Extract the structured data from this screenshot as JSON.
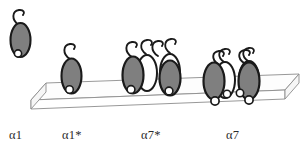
{
  "figure": {
    "type": "schematic-diagram",
    "background_color": "#ffffff",
    "colors": {
      "subunit_fill": "#7f7f7f",
      "subunit_outline": "#1a1a1a",
      "ghost_subunit_fill": "#ffffff",
      "ghost_subunit_outline": "#1a1a1a",
      "pore_circle_fill": "#ffffff",
      "pore_circle_outline": "#1a1a1a",
      "membrane_face": "#fdfdfd",
      "membrane_edge": "#8c8c8c",
      "tail_stroke": "#1a1a1a",
      "label_text": "#2b2b2b"
    }
  },
  "membrane": {
    "name": "lipid-bilayer-slab",
    "top_face_points": "32,84 296,74 296,74 18,96 18,96 32,84",
    "top_surface": "46,83 298,74 284,90 31,100",
    "front_face": "31,100 284,90 284,99 31,109",
    "left_face": "46,83 31,100 31,109 46,92",
    "slab_top_y": 83,
    "slab_bottom_y": 109,
    "slab_left_x": 18,
    "slab_right_x": 298
  },
  "groups": [
    {
      "id": "a1",
      "label": "α1",
      "label_plain": "alpha-1",
      "state": "unassembled-monomer-off-membrane",
      "in_membrane": false,
      "subunit_count": 1,
      "ghost_count": 0,
      "pore_count": 1,
      "description": "Single free subunit located above and off the membrane"
    },
    {
      "id": "a1s",
      "label": "α1*",
      "label_plain": "alpha-1-star",
      "state": "single-subunit-inserted",
      "in_membrane": true,
      "subunit_count": 1,
      "ghost_count": 0,
      "pore_count": 1,
      "description": "Single subunit inserted in the membrane with long extended tail"
    },
    {
      "id": "a7s",
      "label": "α7*",
      "label_plain": "alpha-7-star",
      "state": "loose-cluster-shallow",
      "in_membrane": true,
      "subunit_count": 2,
      "ghost_count": 2,
      "pore_count": 2,
      "description": "Cluster of subunits resting shallowly on membrane, pores at membrane surface"
    },
    {
      "id": "a7",
      "label": "α7",
      "label_plain": "alpha-7",
      "state": "assembled-cluster-deep",
      "in_membrane": true,
      "subunit_count": 2,
      "ghost_count": 2,
      "pore_count": 4,
      "description": "Assembled cluster inserted deeply, pores protruding below the membrane, tails short and curled"
    }
  ],
  "labels": {
    "a1": "α1",
    "a1_star": "α1*",
    "a7_star": "α7*",
    "a7": "α7"
  }
}
